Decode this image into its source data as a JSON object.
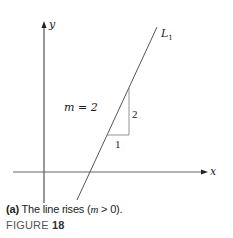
{
  "figure": {
    "axes": {
      "x_label": "x",
      "y_label": "y"
    },
    "line": {
      "label": "L",
      "subscript": "1",
      "slope_text": "m = 2"
    },
    "slope_triangle": {
      "rise_label": "2",
      "run_label": "1"
    },
    "caption": {
      "part_label": "(a)",
      "text_before": " The line rises (",
      "m_symbol": "m",
      "text_after": " > 0)."
    },
    "figure_label": {
      "prefix": "FIGURE ",
      "number": "18"
    }
  },
  "colors": {
    "axis": "#444444",
    "line": "#555555",
    "triangle": "#777777",
    "text": "#222222"
  }
}
